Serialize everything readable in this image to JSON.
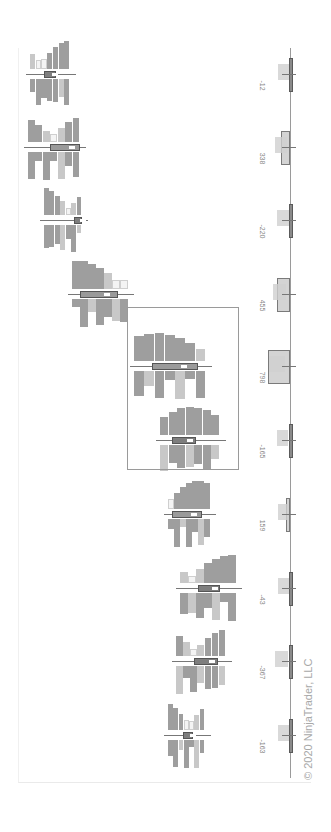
{
  "chart_data": {
    "type": "bar",
    "title": "",
    "orientation": "rotated-90-clockwise",
    "categories": [
      "Bar 1",
      "Bar 2",
      "Bar 3",
      "Bar 4",
      "Bar 5",
      "Bar 6",
      "Bar 7",
      "Bar 8",
      "Bar 9",
      "Bar 10"
    ],
    "series": [
      {
        "name": "Bar Delta",
        "values": [
          -12,
          338,
          -220,
          455,
          798,
          -165,
          159,
          -43,
          -367,
          -163
        ]
      }
    ],
    "delta_labels": [
      "-12",
      "338",
      "-220",
      "455",
      "798",
      "-165",
      "159",
      "-43",
      "-367",
      "-163"
    ],
    "highlight_box": {
      "bars": [
        5,
        6
      ]
    },
    "grid": false,
    "legend": "none",
    "colors": {
      "positive": "#d4d4d4",
      "negative": "#8a8a8a",
      "histogram_dark": "#9e9e9e",
      "histogram_light": "#c8c8c8",
      "poc": "#ffffff"
    }
  },
  "watermark": "© 2020 NinjaTrader, LLC"
}
